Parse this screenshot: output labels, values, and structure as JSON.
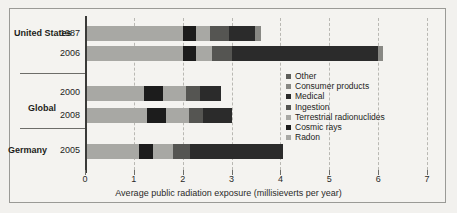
{
  "chart_data": {
    "type": "bar",
    "orientation": "horizontal",
    "stacked": true,
    "title": "",
    "xlabel": "Average public radiation exposure (millisieverts per year)",
    "ylabel": "",
    "xlim": [
      0,
      7
    ],
    "xticks": [
      0,
      1,
      2,
      3,
      4,
      5,
      6,
      7
    ],
    "xticklabels": [
      "0",
      "1",
      "2",
      "3",
      "4",
      "5",
      "6",
      "7"
    ],
    "grid": true,
    "grid_axis": "x",
    "legend_position": "center-right",
    "legend_order_top_to_bottom": [
      "Other",
      "Consumer products",
      "Medical",
      "Ingestion",
      "Terrestrial radionuclides",
      "Cosmic rays",
      "Radon"
    ],
    "series": [
      {
        "name": "Radon",
        "color": "#a8a8a4",
        "values": [
          2.0,
          2.0,
          1.2,
          1.26,
          1.1
        ]
      },
      {
        "name": "Cosmic rays",
        "color": "#1c1c1c",
        "values": [
          0.27,
          0.27,
          0.39,
          0.39,
          0.3
        ]
      },
      {
        "name": "Terrestrial radionuclides",
        "color": "#a8a8a4",
        "values": [
          0.28,
          0.28,
          0.48,
          0.48,
          0.4
        ]
      },
      {
        "name": "Ingestion",
        "color": "#555552",
        "values": [
          0.39,
          0.39,
          0.29,
          0.29,
          0.35
        ]
      },
      {
        "name": "Medical",
        "color": "#2b2b2b",
        "values": [
          0.53,
          3.0,
          0.42,
          0.58,
          1.9
        ]
      },
      {
        "name": "Consumer products",
        "color": "#888884",
        "values": [
          0.1,
          0.1,
          0.0,
          0.0,
          0.0
        ]
      },
      {
        "name": "Other",
        "color": "#5e5e5a",
        "values": [
          0.0,
          0.07,
          0.0,
          0.0,
          0.0
        ]
      }
    ],
    "categories": [
      "1987",
      "2006",
      "2000",
      "2008",
      "2005"
    ],
    "category_groups": [
      {
        "group": "United States",
        "years": [
          "1987",
          "2006"
        ],
        "totals": [
          3.6,
          6.1
        ]
      },
      {
        "group": "Global",
        "years": [
          "2000",
          "2008"
        ],
        "totals": [
          2.78,
          3.0
        ]
      },
      {
        "group": "Germany",
        "years": [
          "2005"
        ],
        "totals": [
          4.05
        ]
      }
    ],
    "bars": [
      {
        "year": "1987",
        "group": "United States",
        "total": 3.6,
        "segments": [
          {
            "name": "Radon",
            "start": 0.0,
            "end": 2.0,
            "color": "#a8a8a4"
          },
          {
            "name": "Cosmic rays",
            "start": 2.0,
            "end": 2.27,
            "color": "#1c1c1c"
          },
          {
            "name": "Terrestrial radionuclides",
            "start": 2.27,
            "end": 2.55,
            "color": "#a8a8a4"
          },
          {
            "name": "Ingestion",
            "start": 2.55,
            "end": 2.94,
            "color": "#555552"
          },
          {
            "name": "Medical",
            "start": 2.94,
            "end": 3.47,
            "color": "#2b2b2b"
          },
          {
            "name": "Consumer products",
            "start": 3.47,
            "end": 3.6,
            "color": "#888884"
          }
        ]
      },
      {
        "year": "2006",
        "group": "United States",
        "total": 6.1,
        "segments": [
          {
            "name": "Radon",
            "start": 0.0,
            "end": 2.0,
            "color": "#a8a8a4"
          },
          {
            "name": "Cosmic rays",
            "start": 2.0,
            "end": 2.27,
            "color": "#1c1c1c"
          },
          {
            "name": "Terrestrial radionuclides",
            "start": 2.27,
            "end": 2.6,
            "color": "#a8a8a4"
          },
          {
            "name": "Ingestion",
            "start": 2.6,
            "end": 3.0,
            "color": "#555552"
          },
          {
            "name": "Medical",
            "start": 3.0,
            "end": 6.0,
            "color": "#2b2b2b"
          },
          {
            "name": "Consumer products",
            "start": 6.0,
            "end": 6.1,
            "color": "#888884"
          }
        ]
      },
      {
        "year": "2000",
        "group": "Global",
        "total": 2.78,
        "segments": [
          {
            "name": "Radon",
            "start": 0.0,
            "end": 1.2,
            "color": "#a8a8a4"
          },
          {
            "name": "Cosmic rays",
            "start": 1.2,
            "end": 1.59,
            "color": "#1c1c1c"
          },
          {
            "name": "Terrestrial radionuclides",
            "start": 1.59,
            "end": 2.07,
            "color": "#a8a8a4"
          },
          {
            "name": "Ingestion",
            "start": 2.07,
            "end": 2.36,
            "color": "#555552"
          },
          {
            "name": "Medical",
            "start": 2.36,
            "end": 2.78,
            "color": "#2b2b2b"
          }
        ]
      },
      {
        "year": "2008",
        "group": "Global",
        "total": 3.0,
        "segments": [
          {
            "name": "Radon",
            "start": 0.0,
            "end": 1.26,
            "color": "#a8a8a4"
          },
          {
            "name": "Cosmic rays",
            "start": 1.26,
            "end": 1.65,
            "color": "#1c1c1c"
          },
          {
            "name": "Terrestrial radionuclides",
            "start": 1.65,
            "end": 2.13,
            "color": "#a8a8a4"
          },
          {
            "name": "Ingestion",
            "start": 2.13,
            "end": 2.42,
            "color": "#555552"
          },
          {
            "name": "Medical",
            "start": 2.42,
            "end": 3.0,
            "color": "#2b2b2b"
          }
        ]
      },
      {
        "year": "2005",
        "group": "Germany",
        "total": 4.05,
        "segments": [
          {
            "name": "Radon",
            "start": 0.0,
            "end": 1.1,
            "color": "#a8a8a4"
          },
          {
            "name": "Cosmic rays",
            "start": 1.1,
            "end": 1.4,
            "color": "#1c1c1c"
          },
          {
            "name": "Terrestrial radionuclides",
            "start": 1.4,
            "end": 1.8,
            "color": "#a8a8a4"
          },
          {
            "name": "Ingestion",
            "start": 1.8,
            "end": 2.15,
            "color": "#555552"
          },
          {
            "name": "Medical",
            "start": 2.15,
            "end": 4.05,
            "color": "#2b2b2b"
          }
        ]
      }
    ]
  },
  "legend": {
    "items": [
      {
        "label": "Other",
        "color": "#5e5e5a"
      },
      {
        "label": "Consumer products",
        "color": "#888884"
      },
      {
        "label": "Medical",
        "color": "#2b2b2b"
      },
      {
        "label": "Ingestion",
        "color": "#555552"
      },
      {
        "label": "Terrestrial radionuclides",
        "color": "#a8a8a4"
      },
      {
        "label": "Cosmic rays",
        "color": "#1c1c1c"
      },
      {
        "label": "Radon",
        "color": "#a8a8a4"
      }
    ]
  },
  "axis": {
    "xlabel": "Average public radiation exposure (millisieverts per year)",
    "ticks": [
      "0",
      "1",
      "2",
      "3",
      "4",
      "5",
      "6",
      "7"
    ]
  },
  "groups": [
    {
      "name": "United States",
      "years": [
        "1987",
        "2006"
      ]
    },
    {
      "name": "Global",
      "years": [
        "2000",
        "2008"
      ]
    },
    {
      "name": "Germany",
      "years": [
        "2005"
      ]
    }
  ]
}
